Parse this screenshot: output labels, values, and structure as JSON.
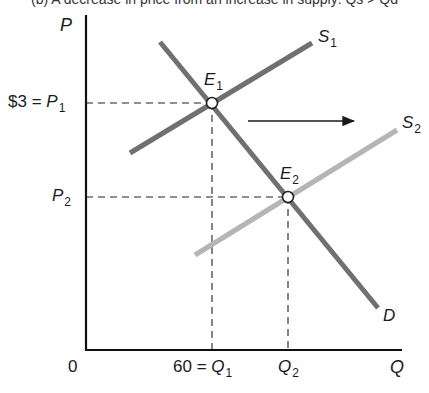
{
  "caption": "(b) A decrease in price from an increase in supply: Qs > Qd",
  "chart_data": {
    "type": "line",
    "title": "",
    "xlabel": "Q",
    "ylabel": "P",
    "origin_label": "0",
    "grid": false,
    "series": [
      {
        "name": "S1",
        "label": "S",
        "sub": "1",
        "color": "#707070",
        "points": [
          [
            130,
            153
          ],
          [
            312,
            43
          ]
        ]
      },
      {
        "name": "S2",
        "label": "S",
        "sub": "2",
        "color": "#b5b5b5",
        "points": [
          [
            195,
            255
          ],
          [
            397,
            130
          ]
        ]
      },
      {
        "name": "D",
        "label": "D",
        "sub": "",
        "color": "#707070",
        "points": [
          [
            160,
            42
          ],
          [
            378,
            308
          ]
        ]
      }
    ],
    "equilibria": [
      {
        "name": "E1",
        "label": "E",
        "sub": "1",
        "x": 212,
        "y": 103,
        "price": "$3",
        "quantity": "60"
      },
      {
        "name": "E2",
        "label": "E",
        "sub": "2",
        "x": 288,
        "y": 197
      }
    ],
    "y_ticks": [
      {
        "text_prefix": "$3 = ",
        "label": "P",
        "sub": "1",
        "y": 103
      },
      {
        "text_prefix": "",
        "label": "P",
        "sub": "2",
        "y": 197
      }
    ],
    "x_ticks": [
      {
        "text_prefix": "60 = ",
        "label": "Q",
        "sub": "1",
        "x": 212
      },
      {
        "text_prefix": "",
        "label": "Q",
        "sub": "2",
        "x": 288
      }
    ],
    "annotations": [
      {
        "type": "arrow",
        "from": [
          248,
          121
        ],
        "to": [
          356,
          121
        ],
        "meaning": "supply shifts right"
      }
    ],
    "axes": {
      "x_axis_y": 350,
      "y_axis_x": 86,
      "x_end": 402,
      "y_top": 15
    }
  },
  "labels": {
    "axis_p": "P",
    "axis_q": "Q",
    "origin": "0",
    "p1_prefix": "$3 = ",
    "p1_main": "P",
    "p1_sub": "1",
    "p2_main": "P",
    "p2_sub": "2",
    "q1_prefix": "60 = ",
    "q1_main": "Q",
    "q1_sub": "1",
    "q2_main": "Q",
    "q2_sub": "2",
    "s1_main": "S",
    "s1_sub": "1",
    "s2_main": "S",
    "s2_sub": "2",
    "d_main": "D",
    "e1_main": "E",
    "e1_sub": "1",
    "e2_main": "E",
    "e2_sub": "2"
  }
}
